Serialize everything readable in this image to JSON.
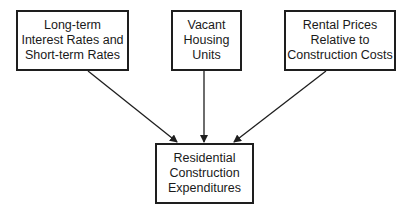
{
  "diagram": {
    "type": "flow",
    "nodes": [
      {
        "id": "interest_rates",
        "lines": [
          "Long-term",
          "Interest Rates and",
          "Short-term Rates"
        ]
      },
      {
        "id": "vacant_housing",
        "lines": [
          "Vacant",
          "Housing",
          "Units"
        ]
      },
      {
        "id": "rental_prices",
        "lines": [
          "Rental Prices",
          "Relative to",
          "Construction Costs"
        ]
      },
      {
        "id": "residential_construction",
        "lines": [
          "Residential",
          "Construction",
          "Expenditures"
        ]
      }
    ],
    "edges": [
      {
        "from": "interest_rates",
        "to": "residential_construction"
      },
      {
        "from": "vacant_housing",
        "to": "residential_construction"
      },
      {
        "from": "rental_prices",
        "to": "residential_construction"
      }
    ],
    "colors": {
      "line": "#1e1e1e",
      "background": "#ffffff"
    }
  }
}
